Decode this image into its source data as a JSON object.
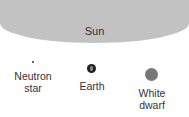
{
  "diagram": {
    "sun": {
      "label": "Sun",
      "color": "#c2c2c2"
    },
    "objects": [
      {
        "id": "neutron-star",
        "label_line1": "Neutron",
        "label_line2": "star",
        "color": "#333333"
      },
      {
        "id": "earth",
        "label_line1": "Earth",
        "label_line2": "",
        "color": "#222222"
      },
      {
        "id": "white-dwarf",
        "label_line1": "White",
        "label_line2": "dwarf",
        "color": "#777777"
      }
    ]
  }
}
